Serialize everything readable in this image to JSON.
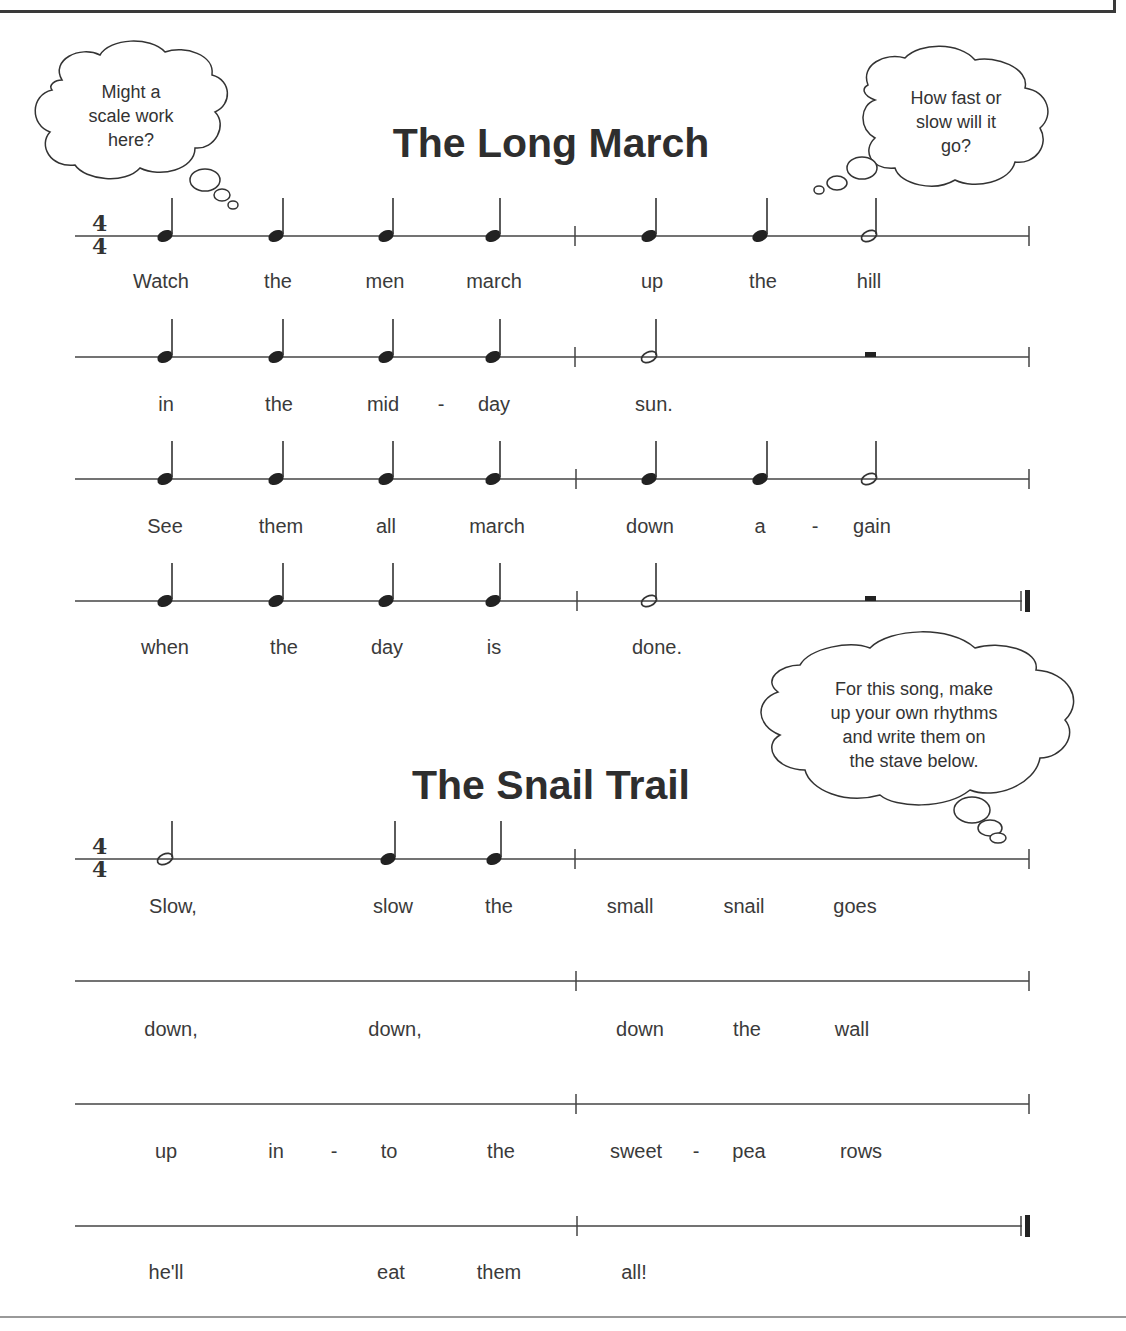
{
  "songs": [
    {
      "title": "The Long March",
      "time_signature": "4/4",
      "lines": [
        {
          "lyrics": [
            "Watch",
            "the",
            "men",
            "march",
            "up",
            "the",
            "hill"
          ]
        },
        {
          "lyrics": [
            "in",
            "the",
            "mid",
            "-",
            "day",
            "sun."
          ]
        },
        {
          "lyrics": [
            "See",
            "them",
            "all",
            "march",
            "down",
            "a",
            "-",
            "gain"
          ]
        },
        {
          "lyrics": [
            "when",
            "the",
            "day",
            "is",
            "done."
          ]
        }
      ]
    },
    {
      "title": "The Snail Trail",
      "time_signature": "4/4",
      "lines": [
        {
          "lyrics": [
            "Slow,",
            "slow",
            "the",
            "small",
            "snail",
            "goes"
          ]
        },
        {
          "lyrics": [
            "down,",
            "down,",
            "down",
            "the",
            "wall"
          ]
        },
        {
          "lyrics": [
            "up",
            "in",
            "-",
            "to",
            "the",
            "sweet",
            "-",
            "pea",
            "rows"
          ]
        },
        {
          "lyrics": [
            "he'll",
            "eat",
            "them",
            "all!"
          ]
        }
      ]
    }
  ],
  "bubbles": [
    {
      "text": "Might a\nscale work\nhere?"
    },
    {
      "text": "How fast or\nslow will it\ngo?"
    },
    {
      "text": "For this song, make\nup your own rhythms\nand write them on\nthe stave below."
    }
  ]
}
